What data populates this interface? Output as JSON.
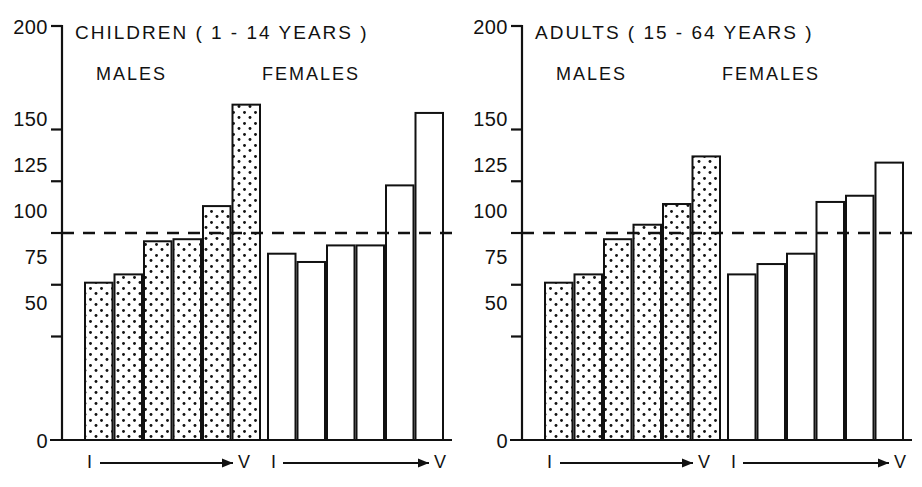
{
  "figure": {
    "background_color": "#ffffff",
    "line_color": "#111111",
    "reference_line_value": 100,
    "panels": [
      {
        "id": "children",
        "title": "CHILDREN   ( 1 - 14  YEARS )",
        "groups": [
          {
            "id": "males",
            "label": "MALES",
            "fill": "stippled"
          },
          {
            "id": "females",
            "label": "FEMALES",
            "fill": "open"
          }
        ],
        "axis_start_label": "I",
        "axis_end_label": "V"
      },
      {
        "id": "adults",
        "title": "ADULTS  ( 15 - 64  YEARS )",
        "groups": [
          {
            "id": "males",
            "label": "MALES",
            "fill": "stippled"
          },
          {
            "id": "females",
            "label": "FEMALES",
            "fill": "open"
          }
        ],
        "axis_start_label": "I",
        "axis_end_label": "V"
      }
    ]
  },
  "chart_data": [
    {
      "type": "bar",
      "title": "CHILDREN   ( 1 - 14  YEARS )",
      "xlabel": "",
      "ylabel": "",
      "ylim": [
        0,
        200
      ],
      "yticks": [
        0,
        50,
        75,
        100,
        125,
        150,
        200
      ],
      "ytick_labels": [
        "0",
        "50",
        "75",
        "100",
        "125",
        "150",
        "200"
      ],
      "grid": false,
      "reference_line": 100,
      "categories": [
        "I",
        "II",
        "III",
        "IV",
        "V",
        "VI"
      ],
      "axis_note": "I —→ V",
      "series": [
        {
          "name": "MALES",
          "fill": "stippled",
          "values": [
            76,
            80,
            96,
            97,
            113,
            162
          ]
        },
        {
          "name": "FEMALES",
          "fill": "open",
          "values": [
            90,
            86,
            94,
            94,
            123,
            158
          ]
        }
      ]
    },
    {
      "type": "bar",
      "title": "ADULTS  ( 15 - 64  YEARS )",
      "xlabel": "",
      "ylabel": "",
      "ylim": [
        0,
        200
      ],
      "yticks": [
        0,
        50,
        75,
        100,
        125,
        150,
        200
      ],
      "ytick_labels": [
        "0",
        "50",
        "75",
        "100",
        "125",
        "150",
        "200"
      ],
      "grid": false,
      "reference_line": 100,
      "categories": [
        "I",
        "II",
        "III",
        "IV",
        "V",
        "VI"
      ],
      "axis_note": "I —→ V",
      "series": [
        {
          "name": "MALES",
          "fill": "stippled",
          "values": [
            76,
            80,
            97,
            104,
            114,
            137
          ]
        },
        {
          "name": "FEMALES",
          "fill": "open",
          "values": [
            80,
            85,
            90,
            115,
            118,
            134
          ]
        }
      ]
    }
  ],
  "panel_children": {
    "title": "CHILDREN   ( 1 - 14  YEARS )",
    "males_label": "MALES",
    "females_label": "FEMALES",
    "ytick_200": "200",
    "ytick_150": "150",
    "ytick_125": "125",
    "ytick_100": "100",
    "ytick_75": "75",
    "ytick_50": "50",
    "ytick_0": "0",
    "axis_start_males": "I",
    "axis_end_males": "V",
    "axis_start_females": "I",
    "axis_end_females": "V"
  },
  "panel_adults": {
    "title": "ADULTS  ( 15 - 64  YEARS )",
    "males_label": "MALES",
    "females_label": "FEMALES",
    "ytick_200": "200",
    "ytick_150": "150",
    "ytick_125": "125",
    "ytick_100": "100",
    "ytick_75": "75",
    "ytick_50": "50",
    "ytick_0": "0",
    "axis_start_males": "I",
    "axis_end_males": "V",
    "axis_start_females": "I",
    "axis_end_females": "V"
  }
}
